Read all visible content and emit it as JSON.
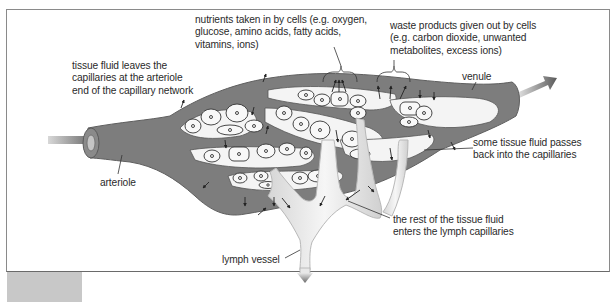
{
  "diagram": {
    "colors": {
      "vessel": "#7d7d7d",
      "vessel_dark": "#5f5f5f",
      "cell_fill": "#f4f4f4",
      "cell_outline": "#3a3a3a",
      "lymph": "#ececec",
      "lymph_outline": "#b8b8b8",
      "frame": "#8a8a8a",
      "text": "#2a2a2a"
    },
    "labels": {
      "nutrients": {
        "lines": [
          "nutrients taken in by cells (e.g. oxygen,",
          "glucose, amino acids, fatty acids,",
          "vitamins, ions)"
        ]
      },
      "waste": {
        "lines": [
          "waste products given out by cells",
          "(e.g. carbon dioxide, unwanted",
          "metabolites, excess ions)"
        ]
      },
      "tissue_fluid_leaves": {
        "lines": [
          "tissue fluid leaves the",
          "capillaries at the arteriole",
          "end of the capillary network"
        ]
      },
      "venule": {
        "lines": [
          "venule"
        ]
      },
      "some_returns": {
        "lines": [
          "some tissue fluid passes",
          "back into the capillaries"
        ]
      },
      "arteriole": {
        "lines": [
          "arteriole"
        ]
      },
      "rest_enters_lymph": {
        "lines": [
          "the rest of the tissue fluid",
          "enters the lymph capillaries"
        ]
      },
      "lymph_vessel": {
        "lines": [
          "lymph vessel"
        ]
      }
    },
    "structures": [
      "arteriole",
      "capillary network",
      "body cells",
      "venule",
      "lymph capillaries",
      "lymph vessel"
    ],
    "flow_arrows": [
      "blood in (arteriole)",
      "blood out (venule)",
      "lymph out (lymph vessel)"
    ]
  }
}
